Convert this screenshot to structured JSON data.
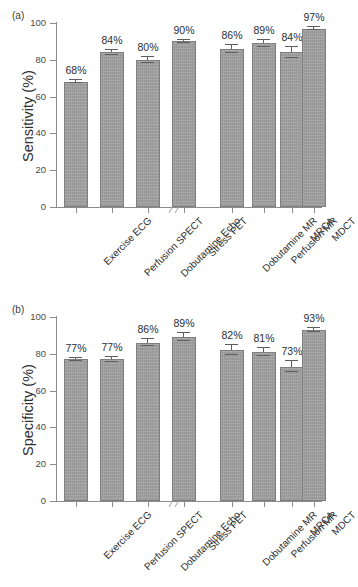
{
  "figure": {
    "panels": [
      {
        "id": "a",
        "label": "(a)"
      },
      {
        "id": "b",
        "label": "(b)"
      }
    ]
  },
  "chart_data": [
    {
      "panel_label": "(a)",
      "type": "bar",
      "title": "",
      "xlabel": "",
      "ylabel": "Sensitivity (%)",
      "ylim": [
        0,
        100
      ],
      "yticks": [
        0,
        20,
        40,
        60,
        80,
        100
      ],
      "ytick_labels": [
        "0",
        "20",
        "40",
        "60",
        "80",
        "100"
      ],
      "grid": false,
      "legend": "none",
      "axis_break_after_category": 4,
      "bar_color": "#9c9c9c",
      "categories": [
        "Exercise ECG",
        "Perfusion SPECT",
        "Dobutamine Echo",
        "Stress PET",
        "Dobutamine MR",
        "Perfusion MR",
        "MRCA",
        "MDCT"
      ],
      "values": [
        68,
        84,
        80,
        90,
        86,
        89,
        84,
        97
      ],
      "data_labels": [
        "68%",
        "84%",
        "80%",
        "90%",
        "86%",
        "89%",
        "84%",
        "97%"
      ],
      "errors": [
        0.8,
        1.3,
        1.5,
        1.0,
        2.2,
        2.0,
        2.8,
        1.0
      ]
    },
    {
      "panel_label": "(b)",
      "type": "bar",
      "title": "",
      "xlabel": "",
      "ylabel": "Specificity (%)",
      "ylim": [
        0,
        100
      ],
      "yticks": [
        0,
        20,
        40,
        60,
        80,
        100
      ],
      "ytick_labels": [
        "0",
        "20",
        "40",
        "60",
        "80",
        "100"
      ],
      "grid": false,
      "legend": "none",
      "axis_break_after_category": 4,
      "bar_color": "#9c9c9c",
      "categories": [
        "Exercise ECG",
        "Perfusion SPECT",
        "Dobutamine Echo",
        "Stress PET",
        "Dobutamine MR",
        "Perfusion MR",
        "MRCA",
        "MDCT"
      ],
      "values": [
        77,
        77,
        86,
        89,
        82,
        81,
        73,
        93
      ],
      "data_labels": [
        "77%",
        "77%",
        "86%",
        "89%",
        "82%",
        "81%",
        "73%",
        "93%"
      ],
      "errors": [
        0.8,
        1.5,
        2.0,
        2.2,
        2.8,
        2.2,
        3.0,
        1.3
      ]
    }
  ]
}
